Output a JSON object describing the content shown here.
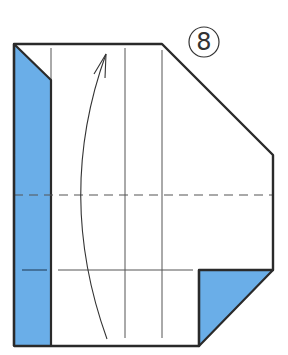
{
  "diagram": {
    "type": "origami-step",
    "step_number": "8",
    "colors": {
      "paper_front": "#ffffff",
      "paper_back": "#6aaee8",
      "outline": "#2a2a2a",
      "crease": "#555555"
    },
    "elements": [
      {
        "name": "paper-outline",
        "kind": "polygon"
      },
      {
        "name": "left-colored-flap",
        "kind": "polygon",
        "color": "blue"
      },
      {
        "name": "bottom-right-colored-triangle",
        "kind": "polygon",
        "color": "blue"
      },
      {
        "name": "valley-fold-line",
        "kind": "dashed-line",
        "orientation": "horizontal"
      },
      {
        "name": "crease-lines",
        "kind": "thin-lines"
      },
      {
        "name": "fold-arrow",
        "kind": "curved-arrow",
        "direction": "up"
      }
    ]
  }
}
